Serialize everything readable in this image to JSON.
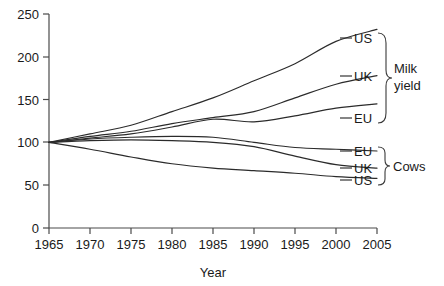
{
  "chart_data": {
    "type": "line",
    "title": "",
    "xlabel": "Year",
    "ylabel": "",
    "xlim": [
      1965,
      2005
    ],
    "ylim": [
      0,
      250
    ],
    "grid": false,
    "legend_position": "right-inline-labels",
    "index_base": "1965 = 100",
    "xticks": [
      "1965",
      "1970",
      "1975",
      "1980",
      "1985",
      "1990",
      "1995",
      "2000",
      "2005"
    ],
    "yticks": [
      "0",
      "50",
      "100",
      "150",
      "200",
      "250"
    ],
    "x": [
      1965,
      1970,
      1975,
      1980,
      1985,
      1990,
      1995,
      2000,
      2005
    ],
    "groups": [
      {
        "name": "Milk yield",
        "label": "Milk yield",
        "label_lines": [
          "Milk",
          "yield"
        ],
        "series": [
          {
            "name": "US",
            "label": "US",
            "values": [
              100,
              110,
              120,
              136,
              152,
              172,
              192,
              218,
              232
            ]
          },
          {
            "name": "UK",
            "label": "UK",
            "values": [
              100,
              107,
              113,
              122,
              129,
              136,
              152,
              168,
              178
            ]
          },
          {
            "name": "EU",
            "label": "EU",
            "values": [
              100,
              105,
              110,
              118,
              127,
              124,
              131,
              140,
              145
            ]
          }
        ]
      },
      {
        "name": "Cows",
        "label": "Cows",
        "label_lines": [
          "Cows"
        ],
        "series": [
          {
            "name": "EU",
            "label": "EU",
            "values": [
              100,
              104,
              106,
              107,
              106,
              100,
              94,
              92,
              90
            ]
          },
          {
            "name": "UK",
            "label": "UK",
            "values": [
              100,
              102,
              103,
              102,
              100,
              95,
              84,
              74,
              70
            ]
          },
          {
            "name": "US",
            "label": "US",
            "values": [
              100,
              92,
              83,
              75,
              70,
              67,
              64,
              60,
              58
            ]
          }
        ]
      }
    ]
  },
  "labels": {
    "milk_us": "US",
    "milk_uk": "UK",
    "milk_eu": "EU",
    "cows_eu": "EU",
    "cows_uk": "UK",
    "cows_us": "US",
    "group_milk_1": "Milk",
    "group_milk_2": "yield",
    "group_cows": "Cows"
  },
  "axis": {
    "x_title": "Year",
    "y0": "0",
    "y50": "50",
    "y100": "100",
    "y150": "150",
    "y200": "200",
    "y250": "250",
    "x1965": "1965",
    "x1970": "1970",
    "x1975": "1975",
    "x1980": "1980",
    "x1985": "1985",
    "x1990": "1990",
    "x1995": "1995",
    "x2000": "2000",
    "x2005": "2005"
  },
  "colors": {
    "line": "#2b2b2b",
    "axis": "#4a4a4a",
    "text": "#1a1a1a",
    "background": "#ffffff"
  }
}
